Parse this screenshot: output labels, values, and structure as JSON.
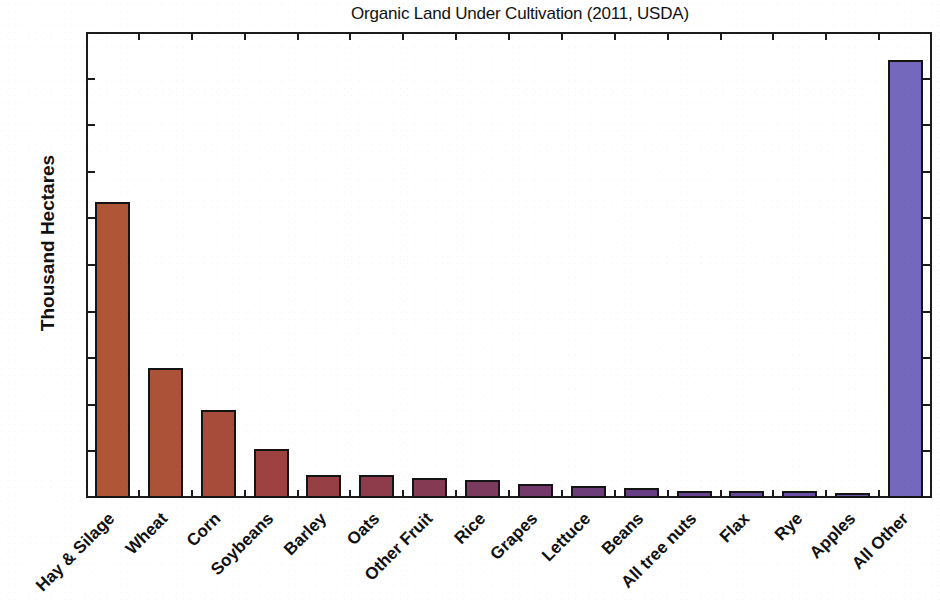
{
  "chart_data": {
    "type": "bar",
    "title": "Organic Land Under Cultivation (2011, USDA)",
    "xlabel": "",
    "ylabel": "Thousand Hectares",
    "ylim": [
      0,
      500
    ],
    "ytick_step": 50,
    "yticks": [
      "0",
      "50",
      "100",
      "150",
      "200",
      "250",
      "300",
      "350",
      "400",
      "450",
      "500"
    ],
    "grid": false,
    "legend": "none",
    "categories": [
      "Hay & Silage",
      "Wheat",
      "Corn",
      "Soybeans",
      "Barley",
      "Oats",
      "Other Fruit",
      "Rice",
      "Grapes",
      "Lettuce",
      "Beans",
      "All tree nuts",
      "Flax",
      "Rye",
      "Apples",
      "All Other"
    ],
    "values": [
      318,
      139,
      94,
      53,
      25,
      25,
      22,
      19,
      15,
      13,
      11,
      8,
      7,
      7,
      5,
      470
    ],
    "bar_colors": [
      "#AE5636",
      "#AC5239",
      "#A74B3B",
      "#9D4240",
      "#963F45",
      "#8E3C4B",
      "#853A54",
      "#7B3A5E",
      "#72396A",
      "#6C3D78",
      "#683F84",
      "#67448F",
      "#674A99",
      "#6A50A4",
      "#6E57AE",
      "#7468BC"
    ],
    "bar_outline_color": "#141414",
    "axis_color": "#1b1b1b",
    "background_color": "#ffffff"
  }
}
